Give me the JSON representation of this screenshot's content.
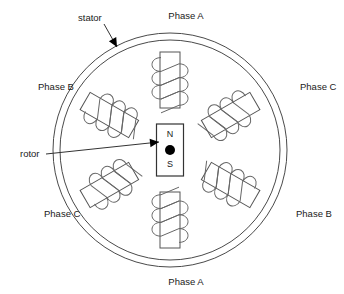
{
  "figure": {
    "kind": "motor-cross-section-diagram",
    "background_color": "#ffffff",
    "line_color": "#555555",
    "text_color": "#1a1a1a",
    "accent_color": "#000000"
  },
  "stator": {
    "label": "stator",
    "label_x": 78,
    "label_y": 18,
    "leader": {
      "x1": 104,
      "y1": 24,
      "x2": 117,
      "y2": 47
    },
    "outer_radius": 117,
    "inner_radius": 110,
    "center_x": 170,
    "center_y": 150
  },
  "rotor": {
    "label": "rotor",
    "label_x": 20,
    "label_y": 154,
    "leader": {
      "x1": 46,
      "y1": 154,
      "x2": 159,
      "y2": 142
    },
    "north_label": "N",
    "south_label": "S",
    "width": 27,
    "height": 52,
    "dot_radius": 5
  },
  "poles": [
    {
      "id": "pole-top",
      "phase": "Phase A",
      "angle_deg": 0,
      "label_x": 186,
      "label_y": 16,
      "label_anchor": "middle"
    },
    {
      "id": "pole-upper-right",
      "phase": "Phase C",
      "angle_deg": 60,
      "label_x": 300,
      "label_y": 87,
      "label_anchor": "start"
    },
    {
      "id": "pole-lower-right",
      "phase": "Phase B",
      "angle_deg": 120,
      "label_x": 296,
      "label_y": 214,
      "label_anchor": "start"
    },
    {
      "id": "pole-bottom",
      "phase": "Phase A",
      "angle_deg": 180,
      "label_x": 186,
      "label_y": 282,
      "label_anchor": "middle"
    },
    {
      "id": "pole-lower-left",
      "phase": "Phase C",
      "angle_deg": 240,
      "label_x": 44,
      "label_y": 214,
      "label_anchor": "start"
    },
    {
      "id": "pole-upper-left",
      "phase": "Phase B",
      "angle_deg": 300,
      "label_x": 38,
      "label_y": 87,
      "label_anchor": "start"
    }
  ],
  "pole_geometry": {
    "length": 56,
    "width": 20,
    "inner_offset": 42,
    "coil_turns": 3,
    "coil_radius": 11
  }
}
